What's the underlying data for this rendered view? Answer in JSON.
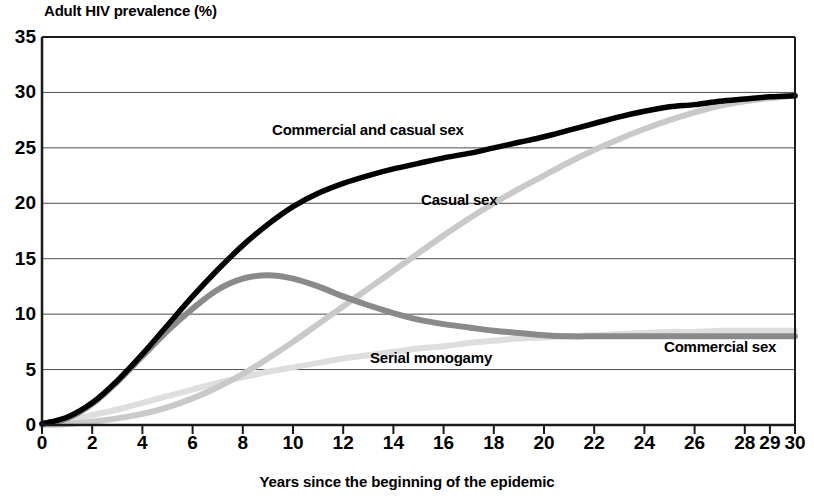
{
  "chart_data": {
    "type": "line",
    "title": "",
    "ylabel": "Adult HIV prevalence (%)",
    "xlabel": "Years since the beginning of the epidemic",
    "xlim": [
      0,
      30
    ],
    "ylim": [
      0,
      35
    ],
    "grid": true,
    "legend_position": "inline-annotations",
    "y_ticks": [
      0,
      5,
      10,
      15,
      20,
      25,
      30,
      35
    ],
    "x_ticks": [
      0,
      2,
      4,
      6,
      8,
      10,
      12,
      14,
      16,
      18,
      20,
      22,
      24,
      26,
      28,
      29,
      30
    ],
    "x": [
      0,
      1,
      2,
      3,
      4,
      5,
      6,
      7,
      8,
      9,
      10,
      11,
      12,
      13,
      14,
      15,
      16,
      17,
      18,
      19,
      20,
      21,
      22,
      23,
      24,
      25,
      26,
      27,
      28,
      29,
      30
    ],
    "series": [
      {
        "name": "Commercial and casual sex",
        "color": "#000000",
        "width": 5.5,
        "label_x": 13.0,
        "label_y": 26.6,
        "values": [
          0.1,
          0.7,
          2.0,
          4.0,
          6.4,
          9.0,
          11.6,
          14.0,
          16.2,
          18.1,
          19.7,
          20.9,
          21.8,
          22.5,
          23.1,
          23.6,
          24.1,
          24.5,
          25.0,
          25.5,
          26.0,
          26.6,
          27.2,
          27.8,
          28.3,
          28.7,
          28.9,
          29.2,
          29.4,
          29.6,
          29.7
        ]
      },
      {
        "name": "Casual sex",
        "color": "#c9c9c9",
        "width": 6.0,
        "label_x": 16.6,
        "label_y": 20.3,
        "values": [
          0.0,
          0.1,
          0.3,
          0.6,
          1.0,
          1.6,
          2.4,
          3.4,
          4.6,
          6.0,
          7.5,
          9.1,
          10.7,
          12.3,
          13.9,
          15.5,
          17.1,
          18.6,
          20.0,
          21.3,
          22.5,
          23.7,
          24.8,
          25.8,
          26.7,
          27.5,
          28.2,
          28.8,
          29.2,
          29.5,
          29.7
        ]
      },
      {
        "name": "Commercial sex",
        "color": "#8a8a8a",
        "width": 6.0,
        "label_x": 27.0,
        "label_y": 7.0,
        "values": [
          0.1,
          0.6,
          1.9,
          3.9,
          6.2,
          8.5,
          10.5,
          12.2,
          13.2,
          13.5,
          13.2,
          12.5,
          11.6,
          10.8,
          10.1,
          9.5,
          9.1,
          8.8,
          8.5,
          8.3,
          8.1,
          8.0,
          8.0,
          8.0,
          8.0,
          8.0,
          8.0,
          8.0,
          8.0,
          8.0,
          8.0
        ]
      },
      {
        "name": "Serial monogamy",
        "color": "#dedede",
        "width": 6.0,
        "label_x": 15.5,
        "label_y": 6.0,
        "values": [
          0.0,
          0.4,
          0.9,
          1.4,
          2.0,
          2.6,
          3.2,
          3.8,
          4.3,
          4.8,
          5.2,
          5.6,
          6.0,
          6.3,
          6.6,
          6.9,
          7.1,
          7.4,
          7.6,
          7.8,
          7.9,
          8.0,
          8.1,
          8.2,
          8.3,
          8.4,
          8.4,
          8.5,
          8.5,
          8.5,
          8.5
        ]
      }
    ]
  },
  "axis": {
    "y_title": "Adult HIV prevalence (%)",
    "x_title": "Years since the beginning of the epidemic",
    "y_tick_labels": [
      "35",
      "30",
      "25",
      "20",
      "15",
      "10",
      "5",
      "0"
    ],
    "x_tick_labels": [
      "0",
      "2",
      "4",
      "6",
      "8",
      "10",
      "12",
      "14",
      "16",
      "18",
      "20",
      "22",
      "24",
      "26",
      "28",
      "29",
      "30"
    ]
  },
  "annotations": [
    {
      "id": "commercial-and-casual-sex",
      "text": "Commercial and casual sex"
    },
    {
      "id": "casual-sex",
      "text": "Casual sex"
    },
    {
      "id": "commercial-sex",
      "text": "Commercial sex"
    },
    {
      "id": "serial-monogamy",
      "text": "Serial monogamy"
    }
  ],
  "colors": {
    "axis": "#1a1a1a",
    "grid": "#4d4d4d",
    "background": "#ffffff"
  }
}
